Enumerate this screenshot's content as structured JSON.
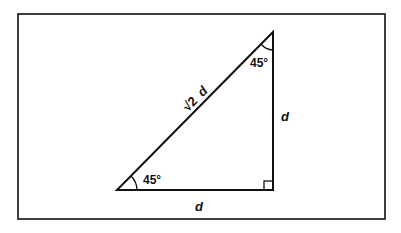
{
  "figure": {
    "stroke_color": "#111111",
    "background_color": "#ffffff",
    "labels": {
      "hypotenuse": "√2 d",
      "hypotenuse_radical": "√2",
      "hypotenuse_var": "d",
      "vertical_leg": "d",
      "horizontal_leg": "d",
      "angle_bottom_left": "45°",
      "angle_top": "45°"
    },
    "vertices": {
      "bottom_left": [
        117,
        190
      ],
      "bottom_right": [
        273,
        190
      ],
      "top": [
        273,
        32
      ]
    }
  }
}
